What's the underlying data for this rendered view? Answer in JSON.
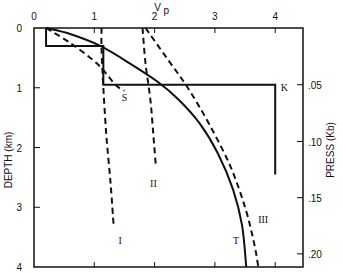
{
  "chart_data": {
    "type": "line",
    "title": "",
    "xlabel": "Vp",
    "ylabel": "DEPTH (km)",
    "y2label": "PRESS (Kb)",
    "xlim": [
      0,
      4.5
    ],
    "ylim": [
      4,
      0
    ],
    "x_ticks": [
      "0",
      "1",
      "2",
      "3",
      "4"
    ],
    "y_ticks": [
      "0",
      "1",
      "2",
      "3",
      "4"
    ],
    "y2_ticks": [
      ".05",
      ".10",
      ".15",
      ".20"
    ],
    "y2_tick_depths": [
      0.95,
      1.9,
      2.84,
      3.78
    ],
    "grid": false,
    "legend": "none (curves labeled inline)",
    "series": [
      {
        "name": "T",
        "style": "solid",
        "points": [
          [
            0.2,
            0
          ],
          [
            0.6,
            0.1
          ],
          [
            1.1,
            0.3
          ],
          [
            1.6,
            0.6
          ],
          [
            2.05,
            0.9
          ],
          [
            2.4,
            1.2
          ],
          [
            2.75,
            1.6
          ],
          [
            3.05,
            2.1
          ],
          [
            3.3,
            2.7
          ],
          [
            3.45,
            3.3
          ],
          [
            3.52,
            4.0
          ]
        ]
      },
      {
        "name": "III",
        "style": "dashed",
        "points": [
          [
            1.85,
            0
          ],
          [
            2.2,
            0.5
          ],
          [
            2.55,
            1.0
          ],
          [
            2.9,
            1.6
          ],
          [
            3.25,
            2.3
          ],
          [
            3.5,
            3.0
          ],
          [
            3.65,
            3.6
          ],
          [
            3.72,
            4.0
          ]
        ]
      },
      {
        "name": "II",
        "style": "dashed",
        "points": [
          [
            1.8,
            0
          ],
          [
            1.85,
            0.6
          ],
          [
            1.93,
            1.2
          ],
          [
            1.98,
            1.8
          ],
          [
            2.02,
            2.3
          ]
        ]
      },
      {
        "name": "I",
        "style": "dashed",
        "points": [
          [
            1.12,
            0
          ],
          [
            1.12,
            0.35
          ],
          [
            1.15,
            1.0
          ],
          [
            1.2,
            1.8
          ],
          [
            1.27,
            2.6
          ],
          [
            1.32,
            3.3
          ]
        ]
      },
      {
        "name": "S",
        "style": "dashed",
        "points": [
          [
            0.2,
            0
          ],
          [
            0.6,
            0.25
          ],
          [
            1.05,
            0.6
          ],
          [
            1.35,
            0.95
          ],
          [
            1.5,
            1.05
          ]
        ]
      },
      {
        "name": "K",
        "style": "solid-step",
        "points": [
          [
            0.2,
            0
          ],
          [
            0.2,
            0.3
          ],
          [
            1.15,
            0.3
          ],
          [
            1.15,
            0.95
          ],
          [
            4.0,
            0.95
          ],
          [
            4.0,
            2.45
          ]
        ]
      }
    ],
    "annotations": [
      {
        "text": "S",
        "x": 1.5,
        "y": 1.15
      },
      {
        "text": "K",
        "x": 4.15,
        "y": 0.98
      },
      {
        "text": "I",
        "x": 1.43,
        "y": 3.55
      },
      {
        "text": "II",
        "x": 1.98,
        "y": 2.6
      },
      {
        "text": "III",
        "x": 3.8,
        "y": 3.2
      },
      {
        "text": "T",
        "x": 3.35,
        "y": 3.55
      }
    ]
  },
  "labels": {
    "x_title": "V",
    "x_title_sub": "p",
    "y_title": "DEPTH (km)",
    "y2_title": "PRESS (Kb)"
  }
}
